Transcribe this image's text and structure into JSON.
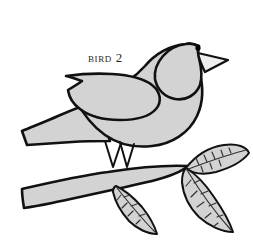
{
  "figure": {
    "caption": "Bird 2",
    "background_color": "#ffffff",
    "fill_color": "#d3d3d3",
    "outline_color": "#111111",
    "eye_color": "#000000",
    "beak_color": "#eeeeee",
    "vein_color": "#333333"
  },
  "parts": {
    "body": "bird-body",
    "wing": "bird-wing",
    "tail": "bird-tail",
    "head": "bird-head",
    "beak": "bird-beak",
    "eye": "bird-eye",
    "leg_front": "bird-leg-front",
    "leg_back": "bird-leg-back",
    "branch": "branch-ribbon",
    "leaf_upper_right": "leaf-upper-right",
    "leaf_lower_right": "leaf-lower-right",
    "leaf_lower_left": "leaf-lower-left"
  },
  "canvas": {
    "width": 253,
    "height": 248
  }
}
